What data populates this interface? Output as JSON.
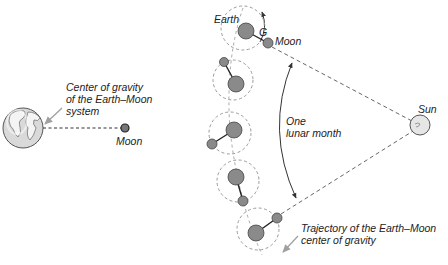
{
  "colors": {
    "body_fill": "#8a8a8a",
    "body_stroke": "#444444",
    "dash_gray": "#9a9a9a",
    "dash_dark": "#555555",
    "arrow_gray": "#a0a0a0",
    "sun_fill": "#e6e6e6",
    "globe_fill": "#d9d9d9"
  },
  "left_panel": {
    "cog_label_lines": [
      "Center of gravity",
      "of the Earth–Moon",
      "system"
    ],
    "moon_label": "Moon",
    "earth_globe": {
      "cx": 23,
      "cy": 128,
      "r": 20
    },
    "moon": {
      "cx": 125,
      "cy": 128,
      "r": 4
    }
  },
  "right_panel": {
    "earth_label": "Earth",
    "g_label": "G",
    "moon_label": "Moon",
    "sun_label": "Sun",
    "month_label_lines": [
      "One",
      "lunar month"
    ],
    "trajectory_label_lines": [
      "Trajectory of the Earth–Moon",
      "center of gravity"
    ],
    "sun": {
      "cx": 420,
      "cy": 125,
      "r": 10
    },
    "positions": [
      {
        "ring": {
          "cx": 243,
          "cy": 28,
          "r": 22
        },
        "earth": {
          "cx": 246,
          "cy": 31,
          "r": 8
        },
        "moon": {
          "cx": 268,
          "cy": 43,
          "r": 5
        }
      },
      {
        "ring": {
          "cx": 233,
          "cy": 80,
          "r": 20
        },
        "earth": {
          "cx": 236,
          "cy": 84,
          "r": 8
        },
        "moon": {
          "cx": 224,
          "cy": 62,
          "r": 4.5
        }
      },
      {
        "ring": {
          "cx": 230,
          "cy": 133,
          "r": 21
        },
        "earth": {
          "cx": 234,
          "cy": 130,
          "r": 8
        },
        "moon": {
          "cx": 212,
          "cy": 144,
          "r": 5
        }
      },
      {
        "ring": {
          "cx": 238,
          "cy": 181,
          "r": 21
        },
        "earth": {
          "cx": 236,
          "cy": 177,
          "r": 8
        },
        "moon": {
          "cx": 243,
          "cy": 201,
          "r": 5
        }
      },
      {
        "ring": {
          "cx": 258,
          "cy": 229,
          "r": 21
        },
        "earth": {
          "cx": 256,
          "cy": 233,
          "r": 8
        },
        "moon": {
          "cx": 277,
          "cy": 218,
          "r": 5
        }
      }
    ]
  }
}
